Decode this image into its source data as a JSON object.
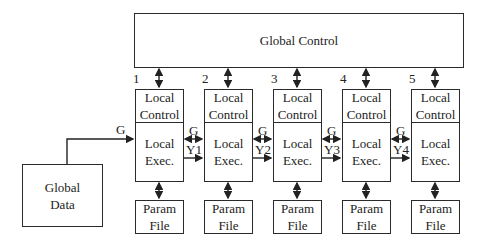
{
  "global_control": {
    "label": "Global Control"
  },
  "global_data": {
    "label": "Global\nData",
    "link_label": "G"
  },
  "processors": [
    {
      "index": "1",
      "local_control": "Local\nControl",
      "local_exec": "Local\nExec.",
      "param_file": "Param\nFile"
    },
    {
      "index": "2",
      "local_control": "Local\nControl",
      "local_exec": "Local\nExec.",
      "param_file": "Param\nFile"
    },
    {
      "index": "3",
      "local_control": "Local\nControl",
      "local_exec": "Local\nExec.",
      "param_file": "Param\nFile"
    },
    {
      "index": "4",
      "local_control": "Local\nControl",
      "local_exec": "Local\nExec.",
      "param_file": "Param\nFile"
    },
    {
      "index": "5",
      "local_control": "Local\nControl",
      "local_exec": "Local\nExec.",
      "param_file": "Param\nFile"
    }
  ],
  "links": [
    {
      "g": "G",
      "y": "Y1"
    },
    {
      "g": "G",
      "y": "Y2"
    },
    {
      "g": "G",
      "y": "Y3"
    },
    {
      "g": "G",
      "y": "Y4"
    }
  ]
}
